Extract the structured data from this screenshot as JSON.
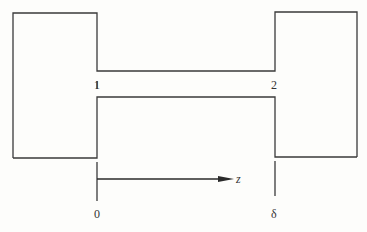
{
  "diagram": {
    "colors": {
      "line": "#3a3a3a",
      "background": "#fdfdfb"
    },
    "labels": {
      "station_1": "1",
      "station_2": "2",
      "axis_variable": "z",
      "origin": "0",
      "length": "δ"
    }
  }
}
